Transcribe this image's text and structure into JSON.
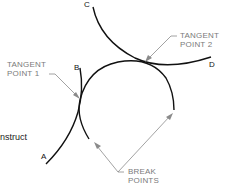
{
  "diagram": {
    "type": "geometric-construction",
    "side_text": "nstruct",
    "points": {
      "A": "A",
      "B": "B",
      "C": "C",
      "D": "D"
    },
    "callouts": {
      "tangent_point_1": [
        "TANGENT",
        "POINT 1"
      ],
      "tangent_point_2": [
        "TANGENT",
        "POINT 2"
      ],
      "break_points": [
        "BREAK",
        "POINTS"
      ]
    },
    "colors": {
      "curve": "#111111",
      "leader": "#8a8a8a",
      "label": "#7a7a7a"
    }
  }
}
